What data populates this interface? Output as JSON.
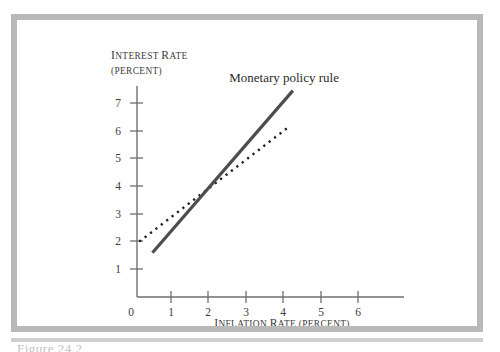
{
  "figure": {
    "caption_partial": "Figure 24.2"
  },
  "chart_data": {
    "type": "line",
    "title": "",
    "xlabel_small_caps": "INFLATION RATE (PERCENT)",
    "ylabel_line1": "INTEREST RATE",
    "ylabel_line2": "(PERCENT)",
    "xlim": [
      0,
      7.1
    ],
    "ylim": [
      0,
      7.9
    ],
    "xticks": [
      0,
      1,
      2,
      3,
      4,
      5,
      6
    ],
    "yticks": [
      0,
      1,
      2,
      3,
      4,
      5,
      6,
      7
    ],
    "xtick_labels": [
      "0",
      "1",
      "2",
      "3",
      "4",
      "5",
      "6"
    ],
    "ytick_labels": [
      "0",
      "1",
      "2",
      "3",
      "4",
      "5",
      "6",
      "7"
    ],
    "grid": false,
    "legend": "none",
    "annotations": [
      {
        "text": "Monetary policy rule",
        "x": 2.55,
        "y": 7.75
      }
    ],
    "series": [
      {
        "name": "Monetary policy rule",
        "style": "solid",
        "color": "#4d4d4d",
        "points": [
          {
            "x": 0.5,
            "y": 1.6
          },
          {
            "x": 4.25,
            "y": 7.45
          }
        ]
      },
      {
        "name": "Reference line",
        "style": "dotted",
        "color": "#1d1d1d",
        "points": [
          {
            "x": 0.15,
            "y": 2.0
          },
          {
            "x": 4.15,
            "y": 6.15
          }
        ]
      }
    ],
    "intersection": {
      "x": 2.1,
      "y": 4.1
    }
  }
}
